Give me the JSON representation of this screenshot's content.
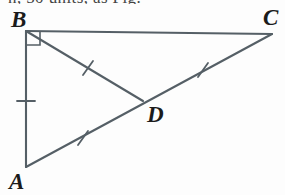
{
  "figure": {
    "type": "geometry-diagram",
    "stroke_color": "#555f66",
    "label_color": "#1b1b1b",
    "background_color": "#fdfdfd",
    "clipped_caption": "n, 50 units, as Fig.",
    "vertices": [
      {
        "name": "B",
        "label": "B",
        "x": 26,
        "y": 31,
        "label_x": 11,
        "label_y": 8
      },
      {
        "name": "C",
        "label": "C",
        "x": 272,
        "y": 34,
        "label_x": 263,
        "label_y": 6
      },
      {
        "name": "A",
        "label": "A",
        "x": 26,
        "y": 167,
        "label_x": 9,
        "label_y": 170
      },
      {
        "name": "D",
        "label": "D",
        "x": 143,
        "y": 101,
        "label_x": 147,
        "label_y": 103
      }
    ],
    "segments": [
      {
        "name": "BC",
        "from": "B",
        "to": "C",
        "ticks": 0
      },
      {
        "name": "AB",
        "from": "A",
        "to": "B",
        "ticks": 1
      },
      {
        "name": "AC",
        "from": "A",
        "to": "C",
        "ticks": 0
      },
      {
        "name": "BD",
        "from": "B",
        "to": "D",
        "ticks": 1
      },
      {
        "name": "AD",
        "from": "A",
        "to": "D",
        "ticks": 1
      },
      {
        "name": "DC",
        "from": "D",
        "to": "C",
        "ticks": 1
      }
    ],
    "tick_marks": [
      {
        "name": "tick-AB",
        "on_segment": "AB",
        "x": 26,
        "y": 101
      },
      {
        "name": "tick-BD",
        "on_segment": "BD",
        "x": 88,
        "y": 68
      },
      {
        "name": "tick-AD",
        "on_segment": "AD",
        "x": 83,
        "y": 138
      },
      {
        "name": "tick-DC",
        "on_segment": "DC",
        "x": 203,
        "y": 70
      }
    ],
    "right_angle": {
      "name": "right-angle-B",
      "at_vertex": "B",
      "size": 14
    }
  }
}
